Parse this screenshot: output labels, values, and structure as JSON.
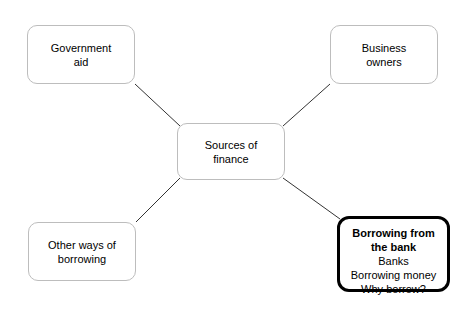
{
  "diagram": {
    "type": "mind-map",
    "title": "Sources of finance",
    "background_color": "#ffffff",
    "node_border_color": "#bdbdbd",
    "highlight_border_color": "#000000",
    "connector_color": "#333333",
    "center": {
      "id": "center",
      "label": "Sources of\nfinance"
    },
    "branches": [
      {
        "id": "government-aid",
        "label": "Government\naid"
      },
      {
        "id": "business-owners",
        "label": "Business\nowners"
      },
      {
        "id": "other-ways-of-borrowing",
        "label": "Other ways of\nborrowing"
      },
      {
        "id": "borrowing-from-the-bank",
        "highlighted": true,
        "title": "Borrowing from\nthe bank",
        "items": [
          "Banks",
          "Borrowing money",
          "Why borrow?"
        ]
      }
    ],
    "connectors": [
      {
        "id": "center-to-government-aid",
        "from": "center",
        "to": "government-aid"
      },
      {
        "id": "center-to-business-owners",
        "from": "center",
        "to": "business-owners"
      },
      {
        "id": "center-to-other-borrowing",
        "from": "center",
        "to": "other-ways-of-borrowing"
      },
      {
        "id": "center-to-borrowing-bank",
        "from": "center",
        "to": "borrowing-from-the-bank"
      }
    ]
  }
}
